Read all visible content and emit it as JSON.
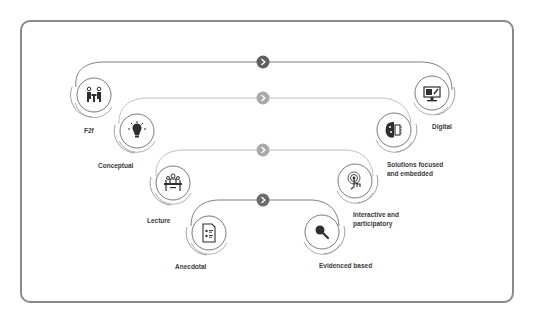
{
  "colors": {
    "frame": "#8a8a8a",
    "line": "#6f6f6f",
    "line_light": "#b9b9b9",
    "chevron_dark": "#5f5f5f",
    "chevron_light": "#a9a9a9",
    "icon": "#2f2f2f",
    "label": "#3a3a3a"
  },
  "levels": [
    {
      "from": {
        "label": "F2f",
        "icon": "meeting-people-icon"
      },
      "to": {
        "label": "Digital",
        "icon": "computer-monitor-icon"
      },
      "connector": "chevron-right-icon",
      "shade": "dark"
    },
    {
      "from": {
        "label": "Conceptual",
        "icon": "lightbulb-icon"
      },
      "to": {
        "label_line1": "Solutions focused",
        "label_line2": "and embedded",
        "icon": "brain-chip-icon"
      },
      "connector": "chevron-right-icon",
      "shade": "light"
    },
    {
      "from": {
        "label": "Lecture",
        "icon": "lecture-panel-icon"
      },
      "to": {
        "label_line1": "Interactive and",
        "label_line2": "participatory",
        "icon": "touch-hand-icon"
      },
      "connector": "chevron-right-icon",
      "shade": "light"
    },
    {
      "from": {
        "label": "Anecdotal",
        "icon": "document-list-icon"
      },
      "to": {
        "label": "Evidenced based",
        "icon": "magnifier-icon"
      },
      "connector": "chevron-right-icon",
      "shade": "dark"
    }
  ]
}
